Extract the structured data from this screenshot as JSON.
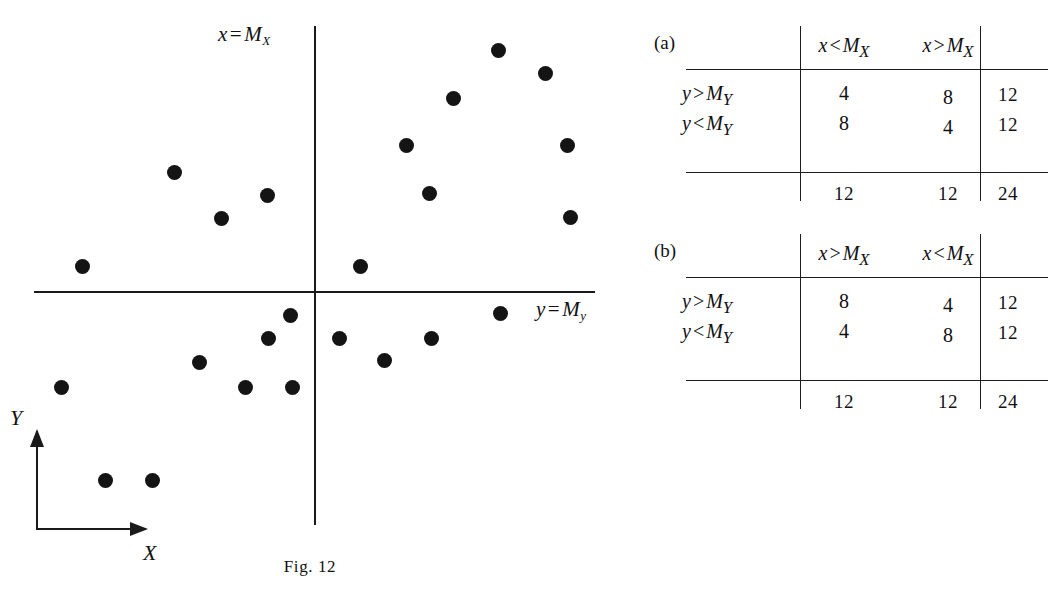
{
  "figure": {
    "caption": "Fig. 12",
    "vertical_median_label": {
      "var": "x",
      "op": "=",
      "median": "M",
      "sub": "X"
    },
    "horizontal_median_label": {
      "var": "y",
      "op": "=",
      "median": "M",
      "sub": "y"
    },
    "orientation_axes": {
      "x_label": "X",
      "y_label": "Y"
    },
    "point_color": "#141414",
    "line_color": "#1a1a1a"
  },
  "chart_data": {
    "type": "scatter",
    "title": "Fig. 12",
    "xlabel": "X",
    "ylabel": "Y",
    "annotations": [
      "x = M_X",
      "y = M_Y"
    ],
    "grid": false,
    "legend": "none",
    "median_lines": {
      "x_at_px": 314,
      "y_at_px": 292
    },
    "n_points": 24,
    "quadrant_counts": {
      "upper_left": 4,
      "upper_right": 8,
      "lower_left": 8,
      "lower_right": 4
    },
    "points_px": [
      [
        498,
        50
      ],
      [
        545,
        73
      ],
      [
        453,
        98
      ],
      [
        406,
        145
      ],
      [
        567,
        145
      ],
      [
        429,
        193
      ],
      [
        570,
        217
      ],
      [
        360,
        266
      ],
      [
        174,
        172
      ],
      [
        267,
        195
      ],
      [
        221,
        218
      ],
      [
        82,
        266
      ],
      [
        290,
        315
      ],
      [
        268,
        338
      ],
      [
        199,
        362
      ],
      [
        245,
        387
      ],
      [
        292,
        387
      ],
      [
        61,
        387
      ],
      [
        105,
        480
      ],
      [
        152,
        480
      ],
      [
        339,
        338
      ],
      [
        431,
        338
      ],
      [
        384,
        360
      ],
      [
        500,
        313
      ]
    ]
  },
  "tables": [
    {
      "tag": "(a)",
      "col_headers": [
        {
          "var": "x",
          "op": "<",
          "median": "M",
          "sub": "X"
        },
        {
          "var": "x",
          "op": ">",
          "median": "M",
          "sub": "X"
        }
      ],
      "row_headers": [
        {
          "var": "y",
          "op": ">",
          "median": "M",
          "sub": "Y"
        },
        {
          "var": "y",
          "op": "<",
          "median": "M",
          "sub": "Y"
        }
      ],
      "values": [
        [
          "4",
          "8"
        ],
        [
          "8",
          "4"
        ]
      ],
      "row_totals": [
        "12",
        "12"
      ],
      "col_totals": [
        "12",
        "12"
      ],
      "grand_total": "24"
    },
    {
      "tag": "(b)",
      "col_headers": [
        {
          "var": "x",
          "op": ">",
          "median": "M",
          "sub": "X"
        },
        {
          "var": "x",
          "op": "<",
          "median": "M",
          "sub": "X"
        }
      ],
      "row_headers": [
        {
          "var": "y",
          "op": ">",
          "median": "M",
          "sub": "Y"
        },
        {
          "var": "y",
          "op": "<",
          "median": "M",
          "sub": "Y"
        }
      ],
      "values": [
        [
          "8",
          "4"
        ],
        [
          "4",
          "8"
        ]
      ],
      "row_totals": [
        "12",
        "12"
      ],
      "col_totals": [
        "12",
        "12"
      ],
      "grand_total": "24"
    }
  ]
}
